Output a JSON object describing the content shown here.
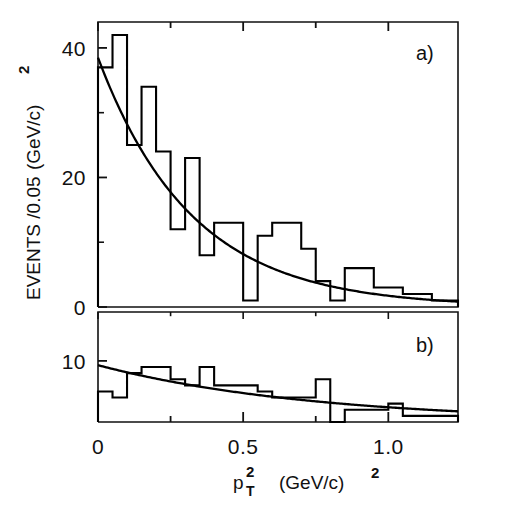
{
  "figure": {
    "background_color": "#ffffff",
    "line_color": "#000000",
    "panel_a_label": "a)",
    "panel_b_label": "b)"
  },
  "axes": {
    "y_title_main": "EVENTS /0.05",
    "y_title_unit": "(GeV/c)",
    "y_title_exponent": "2",
    "x_title_symbol": "p",
    "x_title_sub": "T",
    "x_title_sup": "2",
    "x_title_unit": "(GeV/c)",
    "x_title_unit_exponent": "2",
    "x_ticks_major": [
      "0",
      "0.5",
      "1.0"
    ],
    "x_tick_values": [
      0,
      0.5,
      1.0
    ],
    "x_minor_tick_values": [
      0.25,
      0.75,
      1.25
    ],
    "x_range": [
      0,
      1.24
    ],
    "panel_a_y_ticks": [
      "40",
      "20",
      "0"
    ],
    "panel_a_y_tick_values": [
      40,
      20,
      0
    ],
    "panel_a_y_minor_tick_values": [
      30,
      10
    ],
    "panel_a_y_range": [
      0,
      44
    ],
    "panel_b_y_ticks": [
      "10"
    ],
    "panel_b_y_tick_values": [
      10
    ],
    "panel_b_y_range": [
      0,
      18
    ]
  },
  "chart_data": {
    "type": "bar",
    "title": "",
    "subtitle": "",
    "xlabel": "pT2 (GeV/c)2",
    "ylabel": "EVENTS /0.05 (GeV/c)2",
    "grid": false,
    "legend": "none",
    "bin_width": 0.05,
    "panels": [
      {
        "name": "a",
        "label": "a)",
        "xlim": [
          0,
          1.24
        ],
        "ylim": [
          0,
          44
        ],
        "bin_edges": [
          0.0,
          0.05,
          0.1,
          0.15,
          0.2,
          0.25,
          0.3,
          0.35,
          0.4,
          0.45,
          0.5,
          0.55,
          0.6,
          0.65,
          0.7,
          0.75,
          0.8,
          0.85,
          0.9,
          0.95,
          1.0,
          1.05,
          1.1,
          1.15,
          1.2,
          1.24
        ],
        "values": [
          37,
          42,
          25,
          34,
          24,
          12,
          23,
          8,
          13,
          13,
          1,
          11,
          13,
          13,
          9,
          4,
          1,
          6,
          6,
          3,
          3,
          2,
          2,
          1,
          1
        ],
        "fit": {
          "kind": "exponential",
          "label": "exponential fit",
          "amplitude": 38.5,
          "slope": -3.1,
          "expression": "N = 38.5 * exp(-3.1 * pT^2)"
        }
      },
      {
        "name": "b",
        "label": "b)",
        "xlim": [
          0,
          1.24
        ],
        "ylim": [
          0,
          18
        ],
        "bin_edges": [
          0.0,
          0.05,
          0.1,
          0.15,
          0.2,
          0.25,
          0.3,
          0.35,
          0.4,
          0.45,
          0.5,
          0.55,
          0.6,
          0.65,
          0.7,
          0.75,
          0.8,
          0.85,
          0.9,
          0.95,
          1.0,
          1.05,
          1.1,
          1.15,
          1.2,
          1.24
        ],
        "values": [
          5,
          4,
          8,
          9,
          9,
          7,
          6,
          9,
          6,
          6,
          6,
          5,
          4,
          4,
          4,
          7,
          0,
          2,
          2,
          2,
          3,
          1,
          1,
          1,
          1
        ],
        "fit": {
          "kind": "exponential",
          "label": "exponential fit",
          "amplitude": 9.3,
          "slope": -1.35,
          "expression": "N = 9.3 * exp(-1.35 * pT^2)"
        }
      }
    ]
  }
}
